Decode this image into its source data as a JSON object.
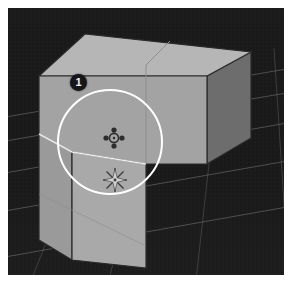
{
  "app": {
    "title": "3D Viewport",
    "type": "3d-modeling-viewport"
  },
  "viewport": {
    "background_color": "#1b1b1b",
    "grid_color": "#6e6e6e",
    "frame_color": "#ffffff"
  },
  "annotations": {
    "step_badges": [
      {
        "label": "1",
        "name": "step-badge-1",
        "x": 62,
        "y": 66,
        "background_color": "#16161a",
        "text_color": "#f2f2f2"
      }
    ],
    "selection_circle": {
      "name": "selection-circle",
      "center_x": 102,
      "center_y": 134,
      "radius": 52,
      "stroke_color": "#ffffff",
      "stroke_width": 2
    },
    "icons": [
      {
        "name": "move-gizmo-icon",
        "label": "move",
        "x": 94,
        "y": 118
      },
      {
        "name": "snap-star-icon",
        "label": "snap",
        "x": 92,
        "y": 156
      }
    ]
  },
  "geometry": {
    "object_name": "box-with-extrusion",
    "faces": [
      {
        "name": "box-top-face",
        "color": "#b5b5b5"
      },
      {
        "name": "box-front-face",
        "color": "#a2a2a2"
      },
      {
        "name": "box-right-face",
        "color": "#6f6f6f"
      },
      {
        "name": "extrusion-front-face",
        "color": "#a8a8a8"
      },
      {
        "name": "extrusion-side-face",
        "color": "#9a9a9a"
      }
    ],
    "edge_color": "#2a2a2a",
    "highlight_edge_color": "#e8e8e8"
  }
}
